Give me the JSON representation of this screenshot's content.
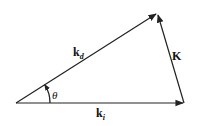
{
  "diagram": {
    "type": "vector-triangle",
    "vectors": [
      {
        "id": "k_i",
        "label": "k",
        "subscript": "i",
        "from": [
          16,
          103
        ],
        "to": [
          184,
          103
        ]
      },
      {
        "id": "k_d",
        "label": "k",
        "subscript": "d",
        "from": [
          16,
          103
        ],
        "to": [
          157,
          13
        ]
      },
      {
        "id": "K",
        "label": "K",
        "subscript": "",
        "from": [
          184,
          103
        ],
        "to": [
          157,
          13
        ]
      }
    ],
    "angle": {
      "label": "θ",
      "between": [
        "k_i",
        "k_d"
      ]
    },
    "colors": {
      "stroke": "#222222",
      "background": "#ffffff"
    }
  }
}
